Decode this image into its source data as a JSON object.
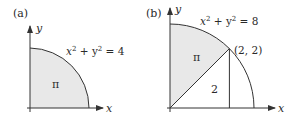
{
  "panels": [
    {
      "label": "(a)",
      "x_axis": "x",
      "y_axis": "y",
      "equation": {
        "lhs_x": "x",
        "exp1": "2",
        "plus": " + ",
        "lhs_y": "y",
        "exp2": "2",
        "rhs": " = 4"
      },
      "region_label": "π",
      "colors": {
        "fill": "#e6e6e6",
        "stroke": "#333333"
      }
    },
    {
      "label": "(b)",
      "x_axis": "x",
      "y_axis": "y",
      "equation": {
        "lhs_x": "x",
        "exp1": "2",
        "plus": " + ",
        "lhs_y": "y",
        "exp2": "2",
        "rhs": " = 8"
      },
      "point_label": "(2, 2)",
      "sector_label": "π",
      "triangle_label": "2",
      "colors": {
        "fill": "#e6e6e6",
        "stroke": "#333333"
      }
    }
  ]
}
